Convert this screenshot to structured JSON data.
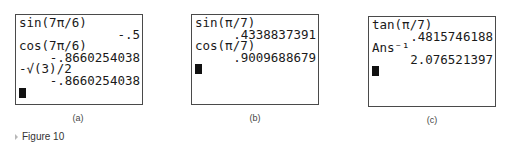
{
  "screens": [
    {
      "id": "a",
      "lines": [
        {
          "text": "sin(7π/6)",
          "align": "left"
        },
        {
          "text": "-.5",
          "align": "right"
        },
        {
          "text": "cos(7π/6)",
          "align": "left"
        },
        {
          "text": "-.8660254038",
          "align": "right"
        },
        {
          "text": "-√(3)/2",
          "align": "left"
        },
        {
          "text": "-.8660254038",
          "align": "right"
        }
      ],
      "caption": "(a)"
    },
    {
      "id": "b",
      "lines": [
        {
          "text": "sin(π/7)",
          "align": "left"
        },
        {
          "text": ".4338837391",
          "align": "right"
        },
        {
          "text": "cos(π/7)",
          "align": "left"
        },
        {
          "text": ".9009688679",
          "align": "right"
        }
      ],
      "caption": "(b)"
    },
    {
      "id": "c",
      "lines": [
        {
          "text": "tan(π/7)",
          "align": "left"
        },
        {
          "text": ".4815746188",
          "align": "right"
        },
        {
          "text": "Ans⁻¹",
          "align": "left"
        },
        {
          "text": "2.076521397",
          "align": "right"
        }
      ],
      "caption": "(c)"
    }
  ],
  "figure": {
    "label": "Figure 10",
    "icon": "triangle-right-icon"
  }
}
